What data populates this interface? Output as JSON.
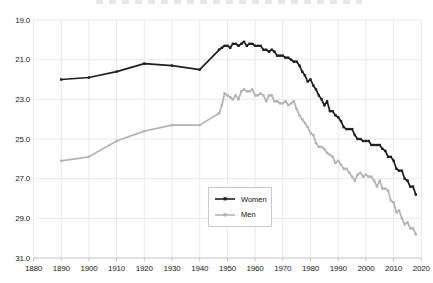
{
  "colors": {
    "background": "#ffffff",
    "grid": "#eae8e8",
    "axis": "#c4c2c2",
    "axis_text": "#1a1a1a",
    "legend_border": "#cbcbcb",
    "women_line": "#1f1f1f",
    "men_line": "#b4b4b4"
  },
  "chart_data": {
    "type": "line",
    "title": "",
    "xlabel": "",
    "ylabel": "",
    "x_ticks": [
      "1880",
      "1890",
      "1900",
      "1910",
      "1920",
      "1930",
      "1940",
      "1950",
      "1960",
      "1970",
      "1980",
      "1990",
      "2000",
      "2010",
      "2020"
    ],
    "y_ticks": [
      "19.0",
      "21.0",
      "23.0",
      "25.0",
      "27.0",
      "29.0",
      "31.0"
    ],
    "xlim": [
      1880,
      2020
    ],
    "value_range": [
      19.0,
      31.0
    ],
    "y_axis_inverted": true,
    "grid": true,
    "legend": {
      "position": "inside-lower-center",
      "entries": [
        {
          "label": "Women"
        },
        {
          "label": "Men"
        }
      ]
    },
    "series": [
      {
        "name": "Women",
        "color": "#1f1f1f",
        "points": [
          [
            1890,
            22.0
          ],
          [
            1900,
            21.9
          ],
          [
            1910,
            21.6
          ],
          [
            1920,
            21.2
          ],
          [
            1930,
            21.3
          ],
          [
            1940,
            21.5
          ],
          [
            1947,
            20.5
          ],
          [
            1948,
            20.4
          ],
          [
            1949,
            20.3
          ],
          [
            1950,
            20.3
          ],
          [
            1951,
            20.4
          ],
          [
            1952,
            20.2
          ],
          [
            1953,
            20.2
          ],
          [
            1954,
            20.3
          ],
          [
            1955,
            20.2
          ],
          [
            1956,
            20.1
          ],
          [
            1957,
            20.3
          ],
          [
            1958,
            20.2
          ],
          [
            1959,
            20.2
          ],
          [
            1960,
            20.3
          ],
          [
            1961,
            20.3
          ],
          [
            1962,
            20.3
          ],
          [
            1963,
            20.5
          ],
          [
            1964,
            20.5
          ],
          [
            1965,
            20.6
          ],
          [
            1966,
            20.5
          ],
          [
            1967,
            20.6
          ],
          [
            1968,
            20.8
          ],
          [
            1969,
            20.8
          ],
          [
            1970,
            20.8
          ],
          [
            1971,
            20.9
          ],
          [
            1972,
            20.9
          ],
          [
            1973,
            21.0
          ],
          [
            1974,
            21.1
          ],
          [
            1975,
            21.1
          ],
          [
            1976,
            21.3
          ],
          [
            1977,
            21.6
          ],
          [
            1978,
            21.8
          ],
          [
            1979,
            22.1
          ],
          [
            1980,
            22.0
          ],
          [
            1981,
            22.3
          ],
          [
            1982,
            22.5
          ],
          [
            1983,
            22.8
          ],
          [
            1984,
            23.0
          ],
          [
            1985,
            23.3
          ],
          [
            1986,
            23.1
          ],
          [
            1987,
            23.6
          ],
          [
            1988,
            23.6
          ],
          [
            1989,
            23.8
          ],
          [
            1990,
            23.9
          ],
          [
            1991,
            24.1
          ],
          [
            1992,
            24.4
          ],
          [
            1993,
            24.5
          ],
          [
            1994,
            24.5
          ],
          [
            1995,
            24.5
          ],
          [
            1996,
            24.8
          ],
          [
            1997,
            25.0
          ],
          [
            1998,
            25.0
          ],
          [
            1999,
            25.1
          ],
          [
            2000,
            25.1
          ],
          [
            2001,
            25.1
          ],
          [
            2002,
            25.3
          ],
          [
            2003,
            25.3
          ],
          [
            2004,
            25.3
          ],
          [
            2005,
            25.3
          ],
          [
            2006,
            25.5
          ],
          [
            2007,
            25.6
          ],
          [
            2008,
            25.9
          ],
          [
            2009,
            25.9
          ],
          [
            2010,
            26.1
          ],
          [
            2011,
            26.5
          ],
          [
            2012,
            26.6
          ],
          [
            2013,
            26.6
          ],
          [
            2014,
            27.0
          ],
          [
            2015,
            27.1
          ],
          [
            2016,
            27.4
          ],
          [
            2017,
            27.4
          ],
          [
            2018,
            27.8
          ]
        ]
      },
      {
        "name": "Men",
        "color": "#b4b4b4",
        "points": [
          [
            1890,
            26.1
          ],
          [
            1900,
            25.9
          ],
          [
            1910,
            25.1
          ],
          [
            1920,
            24.6
          ],
          [
            1930,
            24.3
          ],
          [
            1940,
            24.3
          ],
          [
            1947,
            23.7
          ],
          [
            1948,
            23.3
          ],
          [
            1949,
            22.7
          ],
          [
            1950,
            22.8
          ],
          [
            1951,
            22.9
          ],
          [
            1952,
            23.0
          ],
          [
            1953,
            22.8
          ],
          [
            1954,
            23.0
          ],
          [
            1955,
            22.6
          ],
          [
            1956,
            22.5
          ],
          [
            1957,
            22.6
          ],
          [
            1958,
            22.6
          ],
          [
            1959,
            22.5
          ],
          [
            1960,
            22.8
          ],
          [
            1961,
            22.8
          ],
          [
            1962,
            22.7
          ],
          [
            1963,
            22.8
          ],
          [
            1964,
            23.1
          ],
          [
            1965,
            22.8
          ],
          [
            1966,
            22.8
          ],
          [
            1967,
            23.1
          ],
          [
            1968,
            23.1
          ],
          [
            1969,
            23.2
          ],
          [
            1970,
            23.2
          ],
          [
            1971,
            23.1
          ],
          [
            1972,
            23.3
          ],
          [
            1973,
            23.2
          ],
          [
            1974,
            23.1
          ],
          [
            1975,
            23.5
          ],
          [
            1976,
            23.8
          ],
          [
            1977,
            24.0
          ],
          [
            1978,
            24.2
          ],
          [
            1979,
            24.4
          ],
          [
            1980,
            24.7
          ],
          [
            1981,
            24.8
          ],
          [
            1982,
            25.2
          ],
          [
            1983,
            25.4
          ],
          [
            1984,
            25.4
          ],
          [
            1985,
            25.5
          ],
          [
            1986,
            25.7
          ],
          [
            1987,
            25.8
          ],
          [
            1988,
            25.9
          ],
          [
            1989,
            26.2
          ],
          [
            1990,
            26.1
          ],
          [
            1991,
            26.3
          ],
          [
            1992,
            26.5
          ],
          [
            1993,
            26.5
          ],
          [
            1994,
            26.7
          ],
          [
            1995,
            26.9
          ],
          [
            1996,
            27.1
          ],
          [
            1997,
            26.8
          ],
          [
            1998,
            26.7
          ],
          [
            1999,
            26.9
          ],
          [
            2000,
            26.8
          ],
          [
            2001,
            26.9
          ],
          [
            2002,
            26.9
          ],
          [
            2003,
            27.1
          ],
          [
            2004,
            27.4
          ],
          [
            2005,
            27.1
          ],
          [
            2006,
            27.5
          ],
          [
            2007,
            27.5
          ],
          [
            2008,
            27.6
          ],
          [
            2009,
            28.1
          ],
          [
            2010,
            28.2
          ],
          [
            2011,
            28.7
          ],
          [
            2012,
            28.6
          ],
          [
            2013,
            29.0
          ],
          [
            2014,
            29.3
          ],
          [
            2015,
            29.2
          ],
          [
            2016,
            29.5
          ],
          [
            2017,
            29.5
          ],
          [
            2018,
            29.8
          ]
        ]
      }
    ]
  }
}
